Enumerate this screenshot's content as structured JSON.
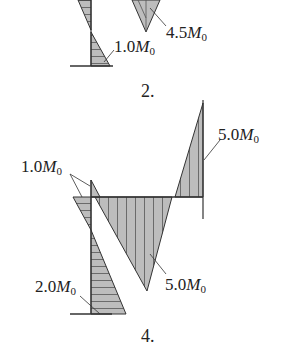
{
  "diagrams": [
    {
      "caption": "2.",
      "labels": [
        {
          "text": "1.0",
          "sub": "0",
          "italic": "M"
        },
        {
          "text": "4.5",
          "sub": "0",
          "italic": "M"
        }
      ]
    },
    {
      "caption": "4.",
      "labels": [
        {
          "text": "1.0",
          "sub": "0",
          "italic": "M"
        },
        {
          "text": "5.0",
          "sub": "0",
          "italic": "M"
        },
        {
          "text": "2.0",
          "sub": "0",
          "italic": "M"
        },
        {
          "text": "5.0",
          "sub": "0",
          "italic": "M"
        }
      ]
    }
  ],
  "colors": {
    "fill": "#b9b9b9",
    "line": "#333333"
  }
}
